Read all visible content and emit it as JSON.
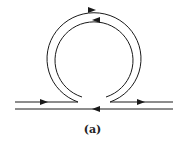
{
  "figure": {
    "caption": "(a)",
    "stroke_color": "#1a1a1a"
  }
}
